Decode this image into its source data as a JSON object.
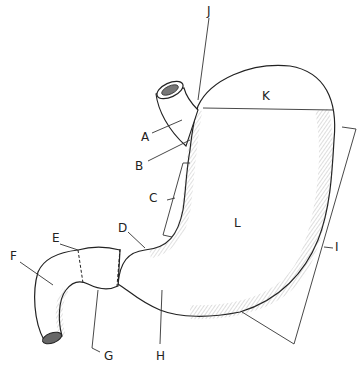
{
  "diagram": {
    "labels": [
      {
        "id": "A",
        "text": "A",
        "x": 141,
        "y": 131
      },
      {
        "id": "B",
        "text": "B",
        "x": 135,
        "y": 160
      },
      {
        "id": "C",
        "text": "C",
        "x": 149,
        "y": 192
      },
      {
        "id": "D",
        "text": "D",
        "x": 118,
        "y": 222
      },
      {
        "id": "E",
        "text": "E",
        "x": 52,
        "y": 232
      },
      {
        "id": "F",
        "text": "F",
        "x": 10,
        "y": 250
      },
      {
        "id": "G",
        "text": "G",
        "x": 104,
        "y": 350
      },
      {
        "id": "H",
        "text": "H",
        "x": 156,
        "y": 350
      },
      {
        "id": "I",
        "text": "I",
        "x": 335,
        "y": 241
      },
      {
        "id": "J",
        "text": "J",
        "x": 207,
        "y": 5
      },
      {
        "id": "K",
        "text": "K",
        "x": 262,
        "y": 90
      },
      {
        "id": "L",
        "text": "L",
        "x": 234,
        "y": 217
      }
    ]
  },
  "colors": {
    "ink": "#222222",
    "background": "#ffffff",
    "shade": "#555555"
  }
}
